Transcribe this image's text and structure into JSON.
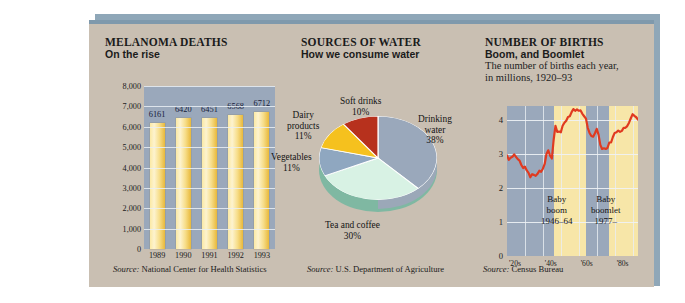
{
  "page": {
    "background": "#ffffff",
    "panel_bg": "#c9bfb2",
    "panel_top_border": "#7f99ac"
  },
  "panels": [
    {
      "id": "melanoma",
      "title": "MELANOMA DEATHS",
      "subtitle": "On the rise",
      "source_prefix": "Source:",
      "source": "National Center for Health Statistics"
    },
    {
      "id": "water",
      "title": "SOURCES OF WATER",
      "subtitle": "How we consume water",
      "source_prefix": "Source:",
      "source": "U.S. Department of Agriculture"
    },
    {
      "id": "births",
      "title": "NUMBER OF BIRTHS",
      "subtitle": "Boom, and Boomlet",
      "description_line1": "The number of births each year,",
      "description_line2": "in millions, 1920–93",
      "source_prefix": "Source:",
      "source": "Census Bureau"
    }
  ],
  "chart_data": [
    {
      "type": "bar",
      "title": "MELANOMA DEATHS",
      "subtitle": "On the rise",
      "categories": [
        "1989",
        "1990",
        "1991",
        "1992",
        "1993"
      ],
      "values": [
        6161,
        6420,
        6451,
        6568,
        6712
      ],
      "value_labels": [
        "6161",
        "6420",
        "6451",
        "6568",
        "6712"
      ],
      "ylabel": "",
      "xlabel": "",
      "ylim": [
        0,
        8000
      ],
      "yticks": [
        0,
        1000,
        2000,
        3000,
        4000,
        5000,
        6000,
        7000,
        8000
      ],
      "ytick_labels": [
        "0",
        "1,000",
        "2,000",
        "3,000",
        "4,000",
        "5,000",
        "6,000",
        "7,000",
        "8,000"
      ],
      "grid": true,
      "legend": "none",
      "plot_bg": "#9aa8bb",
      "bar_color": "#f2d266",
      "source": "Source: National Center for Health Statistics"
    },
    {
      "type": "pie",
      "title": "SOURCES OF WATER",
      "subtitle": "How we consume water",
      "labels": [
        "Drinking water",
        "Tea and coffee",
        "Vegetables",
        "Dairy products",
        "Soft drinks"
      ],
      "values": [
        38,
        30,
        11,
        11,
        10
      ],
      "value_labels": [
        "38%",
        "30%",
        "11%",
        "11%",
        "10%"
      ],
      "colors": [
        "#9aa8bb",
        "#d8f2e4",
        "#8fa7c0",
        "#f5c11e",
        "#b7311d"
      ],
      "legend": "labels-around-slices",
      "source": "Source: U.S. Department of Agriculture"
    },
    {
      "type": "line",
      "title": "NUMBER OF BIRTHS",
      "subtitle": "Boom, and Boomlet",
      "description": "The number of births each year, in millions, 1920–93",
      "xlabel": "",
      "ylabel": "millions",
      "ylim": [
        0,
        4.4
      ],
      "yticks": [
        0,
        1,
        2,
        3,
        4
      ],
      "ytick_labels": [
        "0",
        "1",
        "2",
        "3",
        "4"
      ],
      "xlim": [
        1920,
        1993
      ],
      "xticks": [
        1925,
        1945,
        1965,
        1985
      ],
      "xtick_labels": [
        "'20s",
        "'40s",
        "'60s",
        "'80s"
      ],
      "grid": true,
      "line_color": "#e03a20",
      "plot_bg": "#9aa8bb",
      "band_color": "#f7e6a8",
      "annotations": [
        {
          "label_line1": "Baby",
          "label_line2": "boom",
          "label_line3": "1946–64",
          "span": [
            1946,
            1964
          ]
        },
        {
          "label_line1": "Baby",
          "label_line2": "boomlet",
          "label_line3": "1977–",
          "span": [
            1977,
            1993
          ]
        }
      ],
      "x": [
        1920,
        1921,
        1922,
        1923,
        1924,
        1925,
        1926,
        1927,
        1928,
        1929,
        1930,
        1931,
        1932,
        1933,
        1934,
        1935,
        1936,
        1937,
        1938,
        1939,
        1940,
        1941,
        1942,
        1943,
        1944,
        1945,
        1946,
        1947,
        1948,
        1949,
        1950,
        1951,
        1952,
        1953,
        1954,
        1955,
        1956,
        1957,
        1958,
        1959,
        1960,
        1961,
        1962,
        1963,
        1964,
        1965,
        1966,
        1967,
        1968,
        1969,
        1970,
        1971,
        1972,
        1973,
        1974,
        1975,
        1976,
        1977,
        1978,
        1979,
        1980,
        1981,
        1982,
        1983,
        1984,
        1985,
        1986,
        1987,
        1988,
        1989,
        1990,
        1991,
        1992,
        1993
      ],
      "y": [
        2.95,
        2.82,
        2.88,
        2.91,
        2.98,
        2.91,
        2.84,
        2.8,
        2.67,
        2.58,
        2.62,
        2.51,
        2.44,
        2.31,
        2.4,
        2.38,
        2.35,
        2.41,
        2.5,
        2.47,
        2.56,
        2.7,
        2.99,
        3.1,
        2.94,
        2.86,
        3.41,
        3.82,
        3.64,
        3.65,
        3.63,
        3.82,
        3.91,
        3.97,
        4.08,
        4.1,
        4.22,
        4.31,
        4.26,
        4.3,
        4.26,
        4.27,
        4.17,
        4.1,
        4.03,
        3.76,
        3.61,
        3.52,
        3.5,
        3.6,
        3.73,
        3.56,
        3.26,
        3.14,
        3.16,
        3.14,
        3.17,
        3.33,
        3.33,
        3.49,
        3.61,
        3.63,
        3.68,
        3.64,
        3.67,
        3.76,
        3.76,
        3.81,
        3.91,
        4.04,
        4.16,
        4.11,
        4.07,
        4.0
      ]
    }
  ]
}
